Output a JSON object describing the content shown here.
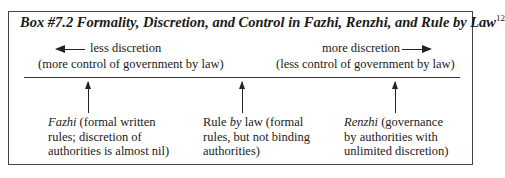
{
  "box": {
    "title": "Box #7.2  Formality, Discretion, and Control in Fazhi, Renzhi, and Rule by Law",
    "footnote": "12"
  },
  "scale": {
    "left": {
      "direction_label": "less discretion",
      "sub_label": "(more control of government by law)"
    },
    "right": {
      "direction_label": "more discretion",
      "sub_label": "(less control of government by law)"
    }
  },
  "points": [
    {
      "term": "Fazhi",
      "term_italic": true,
      "lines": [
        "(formal written",
        "rules; discretion of",
        "authorities is almost nil)"
      ]
    },
    {
      "term_prefix": "Rule ",
      "term_italic_word": "by",
      "term_suffix": " law",
      "lines": [
        "(formal",
        "rules, but not binding",
        "authorities)"
      ]
    },
    {
      "term": "Renzhi",
      "term_italic": true,
      "lines": [
        "(governance",
        "by authorities with",
        "unlimited discretion)"
      ]
    }
  ]
}
